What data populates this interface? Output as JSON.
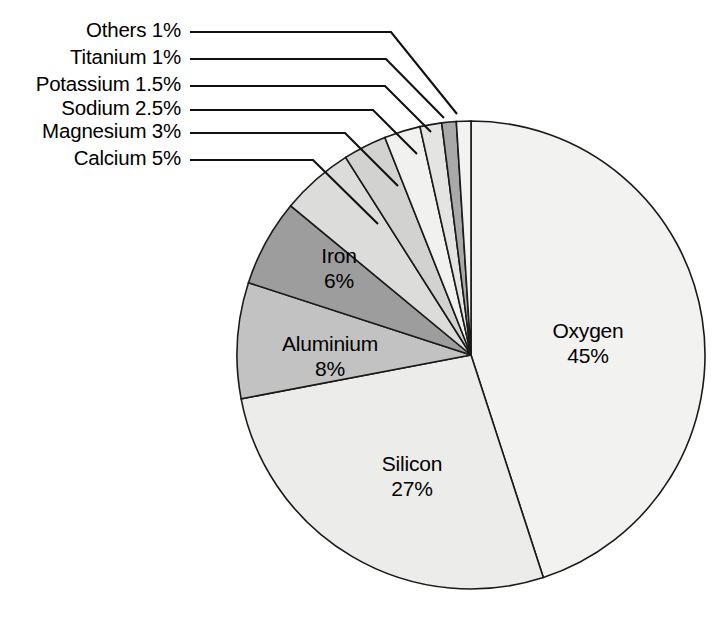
{
  "figure": {
    "width": 727,
    "height": 633,
    "background": "#ffffff"
  },
  "chart_data": {
    "type": "pie",
    "title": "",
    "xlabel": "",
    "ylabel": "",
    "legend_position": "none",
    "grid": false,
    "units": "percent",
    "start_angle_deg": 0,
    "direction": "clockwise",
    "categories": [
      "Oxygen",
      "Silicon",
      "Aluminium",
      "Iron",
      "Calcium",
      "Magnesium",
      "Sodium",
      "Potassium",
      "Titanium",
      "Others"
    ],
    "values": [
      45,
      27,
      8,
      6,
      5,
      3,
      2.5,
      1.5,
      1,
      1
    ],
    "labels": [
      "Oxygen 45%",
      "Silicon 27%",
      "Aluminium 8%",
      "Iron 6%",
      "Calcium 5%",
      "Magnesium 3%",
      "Sodium 2.5%",
      "Potassium 1.5%",
      "Titanium 1%",
      "Others 1%"
    ],
    "slices": [
      {
        "name": "Oxygen",
        "value": 45,
        "value_text": "45%",
        "color": "#f2f2f0",
        "label_placement": "inside",
        "label_line1": "Oxygen",
        "label_line2": "45%",
        "label_x": 588,
        "label_y": 338
      },
      {
        "name": "Silicon",
        "value": 27,
        "value_text": "27%",
        "color": "#ececeb",
        "label_placement": "inside",
        "label_line1": "Silicon",
        "label_line2": "27%",
        "label_x": 412,
        "label_y": 471
      },
      {
        "name": "Aluminium",
        "value": 8,
        "value_text": "8%",
        "color": "#c2c2c2",
        "label_placement": "inside",
        "label_line1": "Aluminium",
        "label_line2": "8%",
        "label_x": 330,
        "label_y": 351
      },
      {
        "name": "Iron",
        "value": 6,
        "value_text": "6%",
        "color": "#9d9d9d",
        "label_placement": "inside",
        "label_line1": "Iron",
        "label_line2": "6%",
        "label_x": 339,
        "label_y": 263
      },
      {
        "name": "Calcium",
        "value": 5,
        "value_text": "5%",
        "color": "#dcdcda",
        "label_placement": "callout",
        "label_text": "Calcium 5%",
        "label_x": 181,
        "label_y": 160,
        "elbow_x": 313,
        "tip_x": 378,
        "tip_y": 224
      },
      {
        "name": "Magnesium",
        "value": 3,
        "value_text": "3%",
        "color": "#d2d2d0",
        "label_placement": "callout",
        "label_text": "Magnesium 3%",
        "label_x": 181,
        "label_y": 133,
        "elbow_x": 345,
        "tip_x": 398,
        "tip_y": 186
      },
      {
        "name": "Sodium",
        "value": 2.5,
        "value_text": "2.5%",
        "color": "#f1f1ef",
        "label_placement": "callout",
        "label_text": "Sodium 2.5%",
        "label_x": 181,
        "label_y": 110,
        "elbow_x": 373,
        "tip_x": 417,
        "tip_y": 154
      },
      {
        "name": "Potassium",
        "value": 1.5,
        "value_text": "1.5%",
        "color": "#e4e4e2",
        "label_placement": "callout",
        "label_text": "Potassium 1.5%",
        "label_x": 181,
        "label_y": 86,
        "elbow_x": 385,
        "tip_x": 431,
        "tip_y": 132
      },
      {
        "name": "Titanium",
        "value": 1,
        "value_text": "1%",
        "color": "#a9a9a9",
        "label_placement": "callout",
        "label_text": "Titanium 1%",
        "label_x": 181,
        "label_y": 59,
        "elbow_x": 386,
        "tip_x": 444,
        "tip_y": 118
      },
      {
        "name": "Others",
        "value": 1,
        "value_text": "1%",
        "color": "#f3f3f1",
        "label_placement": "callout",
        "label_text": "Others 1%",
        "label_x": 181,
        "label_y": 32,
        "elbow_x": 391,
        "tip_x": 457,
        "tip_y": 114
      }
    ],
    "geometry": {
      "center_x": 471,
      "center_y": 355,
      "radius": 234
    }
  }
}
